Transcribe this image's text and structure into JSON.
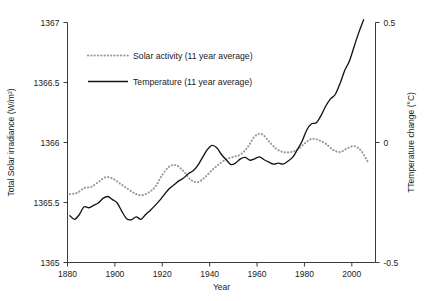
{
  "chart_data": {
    "type": "line",
    "title": "",
    "xlabel": "Year",
    "ylabel": "Total Solar irradiance (W/m²)",
    "y2label": "TTemperature change (°C)",
    "xlim": [
      1880,
      2010
    ],
    "ylim": [
      1365,
      1367
    ],
    "y2lim": [
      -0.5,
      0.5
    ],
    "grid": false,
    "legend_position": "upper-left-inside",
    "xticks": [
      1880,
      1900,
      1920,
      1940,
      1960,
      1980,
      2000
    ],
    "xtick_labels": [
      "1880",
      "1900",
      "1920",
      "1940",
      "1960",
      "1980",
      "2000"
    ],
    "yticks": [
      1365,
      1365.5,
      1366,
      1366.5,
      1367
    ],
    "ytick_labels": [
      "1365",
      "1365.5",
      "1366",
      "1366.5",
      "1367"
    ],
    "y2ticks": [
      -0.5,
      0,
      0.5
    ],
    "y2tick_labels": [
      "-0.5",
      "0",
      "0.5"
    ],
    "series": [
      {
        "name": "Solar activity (11 year average)",
        "legend_label": "Solar activity (11 year average)",
        "axis": "left",
        "style": "dotted",
        "color": "#9a9a9a",
        "x": [
          1881,
          1884,
          1887,
          1890,
          1893,
          1896,
          1899,
          1902,
          1905,
          1908,
          1911,
          1914,
          1917,
          1920,
          1923,
          1926,
          1929,
          1932,
          1935,
          1938,
          1941,
          1944,
          1947,
          1950,
          1953,
          1956,
          1959,
          1962,
          1965,
          1968,
          1971,
          1974,
          1977,
          1980,
          1983,
          1986,
          1989,
          1992,
          1995,
          1998,
          2001,
          2004,
          2007
        ],
        "y": [
          1365.57,
          1365.58,
          1365.62,
          1365.63,
          1365.67,
          1365.71,
          1365.7,
          1365.66,
          1365.62,
          1365.58,
          1365.56,
          1365.58,
          1365.63,
          1365.73,
          1365.8,
          1365.81,
          1365.76,
          1365.69,
          1365.67,
          1365.71,
          1365.77,
          1365.82,
          1365.86,
          1365.88,
          1365.9,
          1365.96,
          1366.05,
          1366.07,
          1366.01,
          1365.95,
          1365.92,
          1365.92,
          1365.94,
          1365.99,
          1366.03,
          1366.02,
          1365.99,
          1365.94,
          1365.92,
          1365.95,
          1365.97,
          1365.93,
          1365.83
        ]
      },
      {
        "name": "Temperature (11 year average)",
        "legend_label": "Temperature (11 year average)",
        "axis": "right",
        "style": "solid",
        "color": "#141414",
        "x": [
          1881,
          1883,
          1885,
          1887,
          1889,
          1891,
          1893,
          1895,
          1897,
          1899,
          1901,
          1903,
          1905,
          1907,
          1909,
          1911,
          1913,
          1915,
          1917,
          1919,
          1921,
          1923,
          1925,
          1927,
          1929,
          1931,
          1933,
          1935,
          1937,
          1939,
          1941,
          1943,
          1945,
          1947,
          1949,
          1951,
          1953,
          1955,
          1957,
          1959,
          1961,
          1963,
          1965,
          1967,
          1969,
          1971,
          1973,
          1975,
          1977,
          1979,
          1981,
          1983,
          1985,
          1987,
          1989,
          1991,
          1993,
          1995,
          1997,
          1999,
          2001,
          2003,
          2005
        ],
        "y": [
          -0.305,
          -0.32,
          -0.3,
          -0.268,
          -0.272,
          -0.262,
          -0.252,
          -0.233,
          -0.225,
          -0.238,
          -0.252,
          -0.288,
          -0.318,
          -0.322,
          -0.31,
          -0.32,
          -0.3,
          -0.282,
          -0.262,
          -0.24,
          -0.215,
          -0.192,
          -0.176,
          -0.16,
          -0.148,
          -0.13,
          -0.118,
          -0.095,
          -0.062,
          -0.03,
          -0.012,
          -0.022,
          -0.05,
          -0.072,
          -0.092,
          -0.085,
          -0.068,
          -0.062,
          -0.074,
          -0.068,
          -0.06,
          -0.072,
          -0.082,
          -0.09,
          -0.086,
          -0.09,
          -0.078,
          -0.062,
          -0.03,
          0.005,
          0.052,
          0.078,
          0.082,
          0.112,
          0.152,
          0.182,
          0.2,
          0.245,
          0.3,
          0.34,
          0.4,
          0.46,
          0.512
        ]
      }
    ]
  }
}
